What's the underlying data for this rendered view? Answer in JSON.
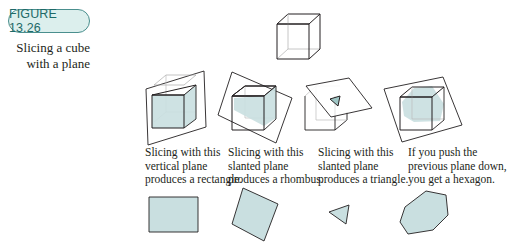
{
  "figure": {
    "label": "FIGURE 13.26",
    "caption_lines": [
      "Slicing a cube",
      "with a plane"
    ],
    "colors": {
      "badge_border": "#4a8f8e",
      "badge_fill": "#dcefed",
      "badge_text": "#1e6a68",
      "section_fill": "#c9dfe0",
      "line": "#231f20"
    }
  },
  "panels": [
    {
      "name": "rectangle",
      "description": [
        "Slicing with this",
        "vertical plane",
        "produces a rectangle."
      ],
      "cross_section": "rectangle"
    },
    {
      "name": "rhombus",
      "description": [
        "Slicing with this",
        "slanted plane",
        "produces a rhombus."
      ],
      "cross_section": "rhombus"
    },
    {
      "name": "triangle",
      "description": [
        "Slicing with this",
        "slanted plane",
        "produces a triangle."
      ],
      "cross_section": "triangle"
    },
    {
      "name": "hexagon",
      "description": [
        "If you push the",
        "previous plane down,",
        "you get a hexagon."
      ],
      "cross_section": "hexagon"
    }
  ]
}
